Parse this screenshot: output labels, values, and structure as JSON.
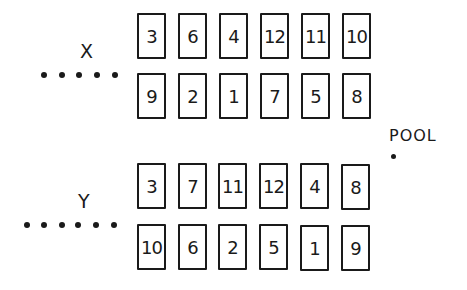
{
  "groups": [
    {
      "label": "X",
      "dot_count": 5,
      "rows": [
        [
          "3",
          "6",
          "4",
          "12",
          "11",
          "10"
        ],
        [
          "9",
          "2",
          "1",
          "7",
          "5",
          "8"
        ]
      ]
    },
    {
      "label": "Y",
      "dot_count": 6,
      "rows": [
        [
          "3",
          "7",
          "11",
          "12",
          "4",
          "8"
        ],
        [
          "10",
          "6",
          "2",
          "5",
          "1",
          "9"
        ]
      ]
    }
  ],
  "pool": {
    "label": "POOL"
  }
}
